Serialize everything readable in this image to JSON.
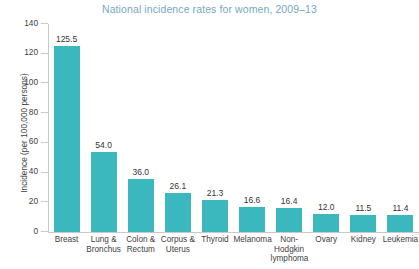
{
  "chart_data": {
    "type": "bar",
    "title": "National incidence rates for women, 2009–13",
    "xlabel": "",
    "ylabel": "Incidence (per 100,000 persons)",
    "ylim": [
      0,
      140
    ],
    "yticks": [
      0,
      20,
      40,
      60,
      80,
      100,
      120,
      140
    ],
    "ytick_labels": [
      "0",
      "20",
      "40",
      "60",
      "80",
      "100",
      "120",
      "140"
    ],
    "grid": false,
    "legend": "none",
    "bar_color": "#3bb8bd",
    "title_color": "#76a9bf",
    "label_color": "#3e3e3e",
    "axis_color": "#c9c9c9",
    "categories": [
      "Breast",
      "Lung & Bronchus",
      "Colon & Rectum",
      "Corpus & Uterus",
      "Thyroid",
      "Melanoma",
      "Non-Hodgkin lymphoma",
      "Ovary",
      "Kidney",
      "Leukemia"
    ],
    "category_lines": [
      [
        "Breast"
      ],
      [
        "Lung &",
        "Bronchus"
      ],
      [
        "Colon &",
        "Rectum"
      ],
      [
        "Corpus &",
        "Uterus"
      ],
      [
        "Thyroid"
      ],
      [
        "Melanoma"
      ],
      [
        "Non-",
        "Hodgkin",
        "lymphoma"
      ],
      [
        "Ovary"
      ],
      [
        "Kidney"
      ],
      [
        "Leukemia"
      ]
    ],
    "values": [
      125.5,
      54.0,
      36.0,
      26.1,
      21.3,
      16.6,
      16.4,
      12.0,
      11.5,
      11.4
    ],
    "value_labels": [
      "125.5",
      "54.0",
      "36.0",
      "26.1",
      "21.3",
      "16.6",
      "16.4",
      "12.0",
      "11.5",
      "11.4"
    ]
  }
}
